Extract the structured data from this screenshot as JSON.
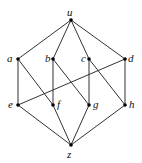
{
  "diagram": {
    "type": "hasse-diagram",
    "nodes": [
      {
        "id": "u",
        "label": "u",
        "x": 71,
        "y": 20,
        "lx": 67,
        "ly": 7
      },
      {
        "id": "a",
        "label": "a",
        "x": 18,
        "y": 59,
        "lx": 7,
        "ly": 53
      },
      {
        "id": "b",
        "label": "b",
        "x": 53,
        "y": 59,
        "lx": 45,
        "ly": 53
      },
      {
        "id": "c",
        "label": "c",
        "x": 89,
        "y": 59,
        "lx": 81,
        "ly": 53
      },
      {
        "id": "d",
        "label": "d",
        "x": 125,
        "y": 59,
        "lx": 128,
        "ly": 53
      },
      {
        "id": "e",
        "label": "e",
        "x": 18,
        "y": 105,
        "lx": 8,
        "ly": 99
      },
      {
        "id": "f",
        "label": "f",
        "x": 53,
        "y": 105,
        "lx": 57,
        "ly": 99
      },
      {
        "id": "g",
        "label": "g",
        "x": 89,
        "y": 105,
        "lx": 93,
        "ly": 99
      },
      {
        "id": "h",
        "label": "h",
        "x": 125,
        "y": 105,
        "lx": 129,
        "ly": 99
      },
      {
        "id": "z",
        "label": "z",
        "x": 71,
        "y": 145,
        "lx": 67,
        "ly": 149
      }
    ],
    "edges": [
      [
        "u",
        "a"
      ],
      [
        "u",
        "b"
      ],
      [
        "u",
        "c"
      ],
      [
        "u",
        "d"
      ],
      [
        "a",
        "e"
      ],
      [
        "a",
        "f"
      ],
      [
        "b",
        "f"
      ],
      [
        "b",
        "g"
      ],
      [
        "c",
        "g"
      ],
      [
        "c",
        "h"
      ],
      [
        "d",
        "e"
      ],
      [
        "d",
        "h"
      ],
      [
        "e",
        "z"
      ],
      [
        "f",
        "z"
      ],
      [
        "g",
        "z"
      ],
      [
        "h",
        "z"
      ]
    ]
  }
}
